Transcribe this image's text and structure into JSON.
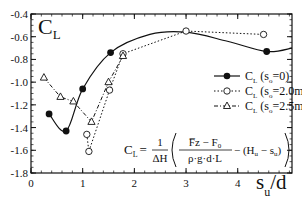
{
  "chart_data": {
    "type": "line",
    "title_main": "C",
    "title_sub": "L",
    "xlabel_main": "s",
    "xlabel_sub": "u",
    "xlabel_tail": "/d",
    "ylabel": "",
    "xlim": [
      0,
      5.05
    ],
    "ylim": [
      -1.8,
      -0.4
    ],
    "xticks": [
      0,
      1,
      2,
      3,
      4
    ],
    "xtick_labels": [
      "0",
      "1",
      "2",
      "3",
      "4"
    ],
    "yticks": [
      -0.4,
      -0.6,
      -0.8,
      -1.0,
      -1.2,
      -1.4,
      -1.6,
      -1.8
    ],
    "ytick_labels": [
      "-0.4",
      "-0.6",
      "-0.8",
      "-1.0",
      "-1.2",
      "-1.4",
      "-1.6",
      "-1.8"
    ],
    "grid": false,
    "legend_position": "right",
    "series": [
      {
        "name": "C_L (s_o=0)",
        "legend_main": "C",
        "legend_sub": "L",
        "legend_paren": " (s",
        "legend_psub": "o",
        "legend_tail": "=0)",
        "marker": "filled-circle",
        "linestyle": "solid",
        "x": [
          0.35,
          0.68,
          1.0,
          1.54,
          4.56
        ],
        "y": [
          -1.28,
          -1.43,
          -1.06,
          -0.74,
          -0.73
        ],
        "curve_extra": {
          "x_start": 3.0,
          "y_start": -0.55,
          "x_end": 5.05,
          "y_end": -0.7
        }
      },
      {
        "name": "C_L (s_o=2.0m)",
        "legend_main": "C",
        "legend_sub": "L",
        "legend_paren": " (s",
        "legend_psub": "o",
        "legend_tail": "=2.0m)",
        "marker": "open-circle",
        "linestyle": "dotted",
        "x": [
          1.08,
          1.12,
          1.52,
          1.78,
          3.0,
          4.5
        ],
        "y": [
          -1.46,
          -1.61,
          -1.07,
          -0.75,
          -0.55,
          -0.58
        ]
      },
      {
        "name": "C_L (s_o=2.5m)",
        "legend_main": "C",
        "legend_sub": "L",
        "legend_paren": " (s",
        "legend_psub": "o",
        "legend_tail": "=2.5m)",
        "marker": "open-triangle",
        "linestyle": "dash-dot",
        "x": [
          0.25,
          0.57,
          0.82,
          1.17,
          1.5,
          1.78
        ],
        "y": [
          -0.96,
          -1.13,
          -1.17,
          -1.35,
          -1.0,
          -0.77
        ]
      }
    ],
    "annotation": {
      "lhs_main": "C",
      "lhs_sub": "L",
      "equals": "=",
      "frac1_num": "1",
      "frac1_den": "ΔH",
      "frac2_num": "F̅z − F",
      "frac2_num_sub": "0",
      "frac2_den": "ρ·g·d·L",
      "tail": "− (H",
      "tail_sub1": "u",
      "tail_mid": " − s",
      "tail_sub2": "u",
      "tail_end": ")"
    }
  }
}
